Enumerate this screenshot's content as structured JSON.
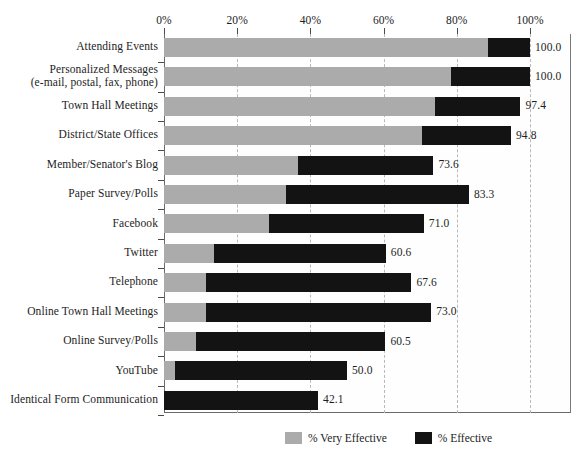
{
  "chart_data": {
    "type": "bar",
    "orientation": "horizontal",
    "stacked": true,
    "title": "",
    "xlabel": "",
    "ylabel": "",
    "xlim": [
      0,
      100
    ],
    "grid": true,
    "gridlines": "dashed vertical at every 20%",
    "legend_position": "bottom-center",
    "x_tick_labels": [
      "0%",
      "20%",
      "40%",
      "60%",
      "80%",
      "100%"
    ],
    "x_ticks": [
      0,
      20,
      40,
      60,
      80,
      100
    ],
    "categories": [
      "Attending Events",
      "Personalized Messages\n(e-mail, postal, fax, phone)",
      "Town Hall Meetings",
      "District/State Offices",
      "Member/Senator's Blog",
      "Paper Survey/Polls",
      "Facebook",
      "Twitter",
      "Telephone",
      "Online Town Hall Meetings",
      "Online Survey/Polls",
      "YouTube",
      "Identical Form Communication"
    ],
    "series": [
      {
        "name": "% Very Effective",
        "color": "#ababab",
        "values": [
          88.5,
          78.5,
          74.0,
          70.5,
          36.6,
          33.2,
          28.8,
          13.7,
          11.5,
          11.5,
          8.8,
          3.0,
          0.0
        ]
      },
      {
        "name": "% Effective",
        "color": "#131313",
        "values": [
          11.5,
          21.5,
          23.4,
          24.3,
          37.0,
          50.1,
          42.2,
          46.9,
          56.1,
          61.5,
          51.7,
          47.0,
          42.1
        ]
      }
    ],
    "totals": [
      100.0,
      100.0,
      97.4,
      94.8,
      73.6,
      83.3,
      71.0,
      60.6,
      67.6,
      73.0,
      60.5,
      50.0,
      42.1
    ],
    "data_labels": [
      "100.0",
      "100.0",
      "97.4",
      "94.8",
      "73.6",
      "83.3",
      "71.0",
      "60.6",
      "67.6",
      "73.0",
      "60.5",
      "50.0",
      "42.1"
    ]
  },
  "legend": {
    "items": [
      {
        "label": "% Very Effective",
        "color": "#ababab"
      },
      {
        "label": "% Effective",
        "color": "#131313"
      }
    ]
  }
}
